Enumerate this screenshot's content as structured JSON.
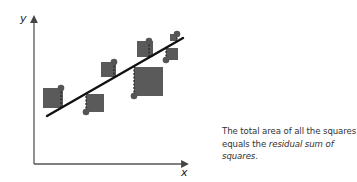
{
  "diagram": {
    "title": "Residual sum of squares",
    "axes": {
      "x_label": "x",
      "y_label": "y"
    },
    "colors": {
      "square": "#5a5a5a",
      "point": "#555555",
      "line": "#111111",
      "axis": "#555555"
    },
    "regression_line": {
      "x1": 47,
      "y1": 116,
      "x2": 183,
      "y2": 38
    },
    "points": [
      {
        "cx": 61,
        "cy": 88,
        "line_y": 108,
        "square": {
          "x": 43,
          "y": 88,
          "size": 20
        }
      },
      {
        "cx": 86,
        "cy": 112,
        "line_y": 94,
        "square": {
          "x": 86,
          "y": 94,
          "size": 18
        }
      },
      {
        "cx": 114,
        "cy": 62,
        "line_y": 79,
        "square": {
          "x": 101,
          "y": 62,
          "size": 15
        }
      },
      {
        "cx": 134,
        "cy": 96,
        "line_y": 67,
        "square": {
          "x": 134,
          "y": 67,
          "size": 29
        }
      },
      {
        "cx": 149,
        "cy": 41,
        "line_y": 58,
        "square": {
          "x": 137,
          "y": 41,
          "size": 16
        }
      },
      {
        "cx": 166,
        "cy": 60,
        "line_y": 48,
        "square": {
          "x": 166,
          "y": 48,
          "size": 12
        }
      },
      {
        "cx": 177,
        "cy": 34,
        "line_y": 41,
        "square": {
          "x": 170,
          "y": 34,
          "size": 7
        }
      }
    ]
  },
  "caption": {
    "line1": "The total area of all the squares",
    "line2_prefix": "equals the ",
    "line2_emphasis": "residual sum of squares",
    "line2_suffix": "."
  }
}
